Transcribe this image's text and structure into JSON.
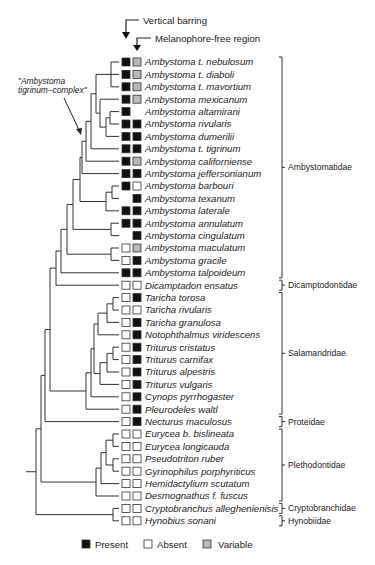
{
  "figure": {
    "column_headers": [
      "Vertical barring",
      "Melanophore-free region"
    ],
    "clade_note": "\"Ambystoma tigrinum–complex\"",
    "clade_note_lines": [
      "\"Ambystoma",
      "tigrinum–complex\""
    ],
    "legend": [
      {
        "state": "present",
        "label": "Present",
        "color": "#111111"
      },
      {
        "state": "absent",
        "label": "Absent",
        "color": "#ffffff"
      },
      {
        "state": "variable",
        "label": "Variable",
        "color": "#b8b8b8"
      }
    ],
    "colors": {
      "present": "#111111",
      "absent": "#ffffff",
      "variable": "#b8b8b8",
      "stroke": "#333333"
    }
  },
  "taxa": [
    {
      "name": "Ambystoma t. nebulosum",
      "barring": "present",
      "melanophore_free": "variable"
    },
    {
      "name": "Ambystoma t. diaboli",
      "barring": "present",
      "melanophore_free": "variable"
    },
    {
      "name": "Ambystoma t. mavortium",
      "barring": "present",
      "melanophore_free": "variable"
    },
    {
      "name": "Ambystoma mexicanum",
      "barring": "present",
      "melanophore_free": "variable"
    },
    {
      "name": "Ambystoma altamirani",
      "barring": "present",
      "melanophore_free": "none"
    },
    {
      "name": "Ambystoma rivularis",
      "barring": "present",
      "melanophore_free": "present"
    },
    {
      "name": "Ambystoma dumerilii",
      "barring": "present",
      "melanophore_free": "present"
    },
    {
      "name": "Ambystoma t. tigrinum",
      "barring": "present",
      "melanophore_free": "present"
    },
    {
      "name": "Ambystoma californiense",
      "barring": "present",
      "melanophore_free": "variable"
    },
    {
      "name": "Ambystoma jeffersonianum",
      "barring": "present",
      "melanophore_free": "present"
    },
    {
      "name": "Ambystoma barbouri",
      "barring": "present",
      "melanophore_free": "absent"
    },
    {
      "name": "Ambystoma texanum",
      "barring": "none",
      "melanophore_free": "present"
    },
    {
      "name": "Ambystoma laterale",
      "barring": "present",
      "melanophore_free": "present"
    },
    {
      "name": "Ambystoma annulatum",
      "barring": "present",
      "melanophore_free": "present"
    },
    {
      "name": "Ambystoma cingulatum",
      "barring": "none",
      "melanophore_free": "present"
    },
    {
      "name": "Ambystoma maculatum",
      "barring": "absent",
      "melanophore_free": "variable"
    },
    {
      "name": "Ambystoma gracile",
      "barring": "absent",
      "melanophore_free": "present"
    },
    {
      "name": "Ambystoma talpoideum",
      "barring": "present",
      "melanophore_free": "present"
    },
    {
      "name": "Dicamptadon ensatus",
      "barring": "absent",
      "melanophore_free": "absent"
    },
    {
      "name": "Taricha torosa",
      "barring": "absent",
      "melanophore_free": "present"
    },
    {
      "name": "Taricha rivularis",
      "barring": "absent",
      "melanophore_free": "absent"
    },
    {
      "name": "Taricha granulosa",
      "barring": "absent",
      "melanophore_free": "present"
    },
    {
      "name": "Notophthalmus viridescens",
      "barring": "absent",
      "melanophore_free": "present"
    },
    {
      "name": "Triturus cristatus",
      "barring": "absent",
      "melanophore_free": "present"
    },
    {
      "name": "Triturus carnifax",
      "barring": "absent",
      "melanophore_free": "present"
    },
    {
      "name": "Triturus alpestris",
      "barring": "absent",
      "melanophore_free": "present"
    },
    {
      "name": "Triturus vulgaris",
      "barring": "absent",
      "melanophore_free": "present"
    },
    {
      "name": "Cynops pyrrhogaster",
      "barring": "absent",
      "melanophore_free": "present"
    },
    {
      "name": "Pleurodeles waltl",
      "barring": "absent",
      "melanophore_free": "present"
    },
    {
      "name": "Necturus maculosus",
      "barring": "absent",
      "melanophore_free": "present"
    },
    {
      "name": "Eurycea b. bislineata",
      "barring": "absent",
      "melanophore_free": "absent"
    },
    {
      "name": "Eurycea longicauda",
      "barring": "absent",
      "melanophore_free": "absent"
    },
    {
      "name": "Pseudotriton ruber",
      "barring": "absent",
      "melanophore_free": "absent"
    },
    {
      "name": "Gyrinophilus porphyriticus",
      "barring": "absent",
      "melanophore_free": "absent"
    },
    {
      "name": "Hemidactylium scutatum",
      "barring": "absent",
      "melanophore_free": "absent"
    },
    {
      "name": "Desmognathus f. fuscus",
      "barring": "absent",
      "melanophore_free": "absent"
    },
    {
      "name": "Cryptobranchus alleghenienisis",
      "barring": "absent",
      "melanophore_free": "absent"
    },
    {
      "name": "Hynobius sonani",
      "barring": "absent",
      "melanophore_free": "absent"
    }
  ],
  "families": [
    {
      "name": "Ambystomatidae",
      "from": 0,
      "to": 17
    },
    {
      "name": "Dicamptodontidae",
      "from": 18,
      "to": 18
    },
    {
      "name": "Salamandridae",
      "from": 19,
      "to": 28
    },
    {
      "name": "Proteidae",
      "from": 29,
      "to": 29
    },
    {
      "name": "Plethodontidae",
      "from": 30,
      "to": 35
    },
    {
      "name": "Cryptobranchidae",
      "from": 36,
      "to": 36
    },
    {
      "name": "Hynobiidae",
      "from": 37,
      "to": 37
    }
  ],
  "layout": {
    "row_top": 62,
    "row_step": 12.4
  }
}
